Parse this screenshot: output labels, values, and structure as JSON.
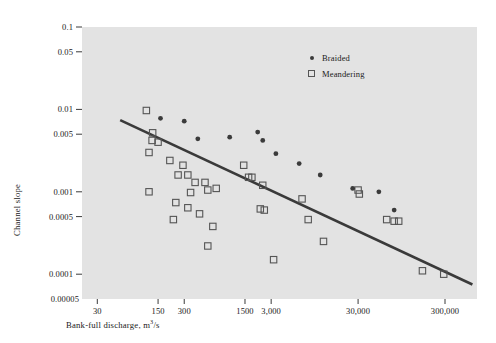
{
  "chart_data": {
    "type": "scatter",
    "title": "",
    "xlabel": "Bank-full discharge, m³/s",
    "ylabel": "Channel slope",
    "xscale": "log",
    "yscale": "log",
    "xlim": [
      20,
      700000
    ],
    "ylim": [
      5e-05,
      0.1
    ],
    "grid": false,
    "legend_position": "top-right",
    "xticks": [
      {
        "value": 30,
        "label": "30"
      },
      {
        "value": 150,
        "label": "150"
      },
      {
        "value": 300,
        "label": "300"
      },
      {
        "value": 1500,
        "label": "1500"
      },
      {
        "value": 3000,
        "label": "3,000"
      },
      {
        "value": 30000,
        "label": "30,000"
      },
      {
        "value": 300000,
        "label": "300,000"
      }
    ],
    "yticks": [
      {
        "value": 0.1,
        "label": "0.1"
      },
      {
        "value": 0.05,
        "label": "0.05"
      },
      {
        "value": 0.01,
        "label": "0.01"
      },
      {
        "value": 0.005,
        "label": "0.005"
      },
      {
        "value": 0.001,
        "label": "0.001"
      },
      {
        "value": 0.0005,
        "label": "0.0005"
      },
      {
        "value": 0.0001,
        "label": "0.0001"
      },
      {
        "value": 5e-05,
        "label": "0.00005"
      }
    ],
    "series": [
      {
        "name": "Braided",
        "marker": "filled-circle",
        "color": "#3b3b3b",
        "points": [
          [
            160,
            0.0078
          ],
          [
            300,
            0.0072
          ],
          [
            430,
            0.0044
          ],
          [
            1000,
            0.0046
          ],
          [
            2100,
            0.0053
          ],
          [
            2400,
            0.0042
          ],
          [
            3400,
            0.0029
          ],
          [
            6300,
            0.0022
          ],
          [
            11000,
            0.0016
          ],
          [
            26000,
            0.0011
          ],
          [
            52000,
            0.001
          ],
          [
            78000,
            0.0006
          ]
        ]
      },
      {
        "name": "Meandering",
        "marker": "open-square",
        "color": "#555555",
        "points": [
          [
            110,
            0.0097
          ],
          [
            130,
            0.0052
          ],
          [
            128,
            0.0042
          ],
          [
            118,
            0.003
          ],
          [
            150,
            0.004
          ],
          [
            205,
            0.0024
          ],
          [
            290,
            0.0021
          ],
          [
            255,
            0.0016
          ],
          [
            330,
            0.0016
          ],
          [
            400,
            0.0013
          ],
          [
            355,
            0.00098
          ],
          [
            520,
            0.0013
          ],
          [
            560,
            0.00105
          ],
          [
            700,
            0.0011
          ],
          [
            118,
            0.001
          ],
          [
            240,
            0.00074
          ],
          [
            225,
            0.00046
          ],
          [
            330,
            0.00064
          ],
          [
            450,
            0.00054
          ],
          [
            640,
            0.00038
          ],
          [
            560,
            0.00022
          ],
          [
            1450,
            0.0021
          ],
          [
            1800,
            0.0015
          ],
          [
            1650,
            0.0015
          ],
          [
            2400,
            0.0012
          ],
          [
            2250,
            0.00062
          ],
          [
            2500,
            0.0006
          ],
          [
            3200,
            0.00015
          ],
          [
            6800,
            0.00082
          ],
          [
            8000,
            0.00046
          ],
          [
            12000,
            0.00025
          ],
          [
            30000,
            0.00105
          ],
          [
            31000,
            0.00094
          ],
          [
            64000,
            0.00046
          ],
          [
            78000,
            0.00044
          ],
          [
            88000,
            0.00044
          ],
          [
            165000,
            0.00011
          ],
          [
            290000,
            0.0001
          ]
        ]
      }
    ],
    "trendline": {
      "name": "regression-line",
      "color": "#3a3a3a",
      "x1": 55,
      "y1": 0.0074,
      "x2": 620000,
      "y2": 7.5e-05
    }
  },
  "legend": {
    "items": [
      {
        "label": "Braided",
        "marker": "filled-circle"
      },
      {
        "label": "Meandering",
        "marker": "open-square"
      }
    ]
  }
}
